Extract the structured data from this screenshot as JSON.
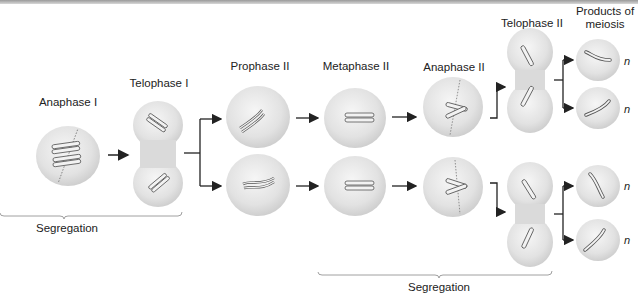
{
  "colors": {
    "cell_fill": "#dcdcdc",
    "cell_highlight": "#f4f4f4",
    "chromosome_fill": "#f2f2f2",
    "chromosome_stroke": "#555555",
    "arrow": "#222222",
    "bracket": "#888888"
  },
  "stages": [
    {
      "id": "anaphase-1",
      "label": "Anaphase I"
    },
    {
      "id": "telophase-1",
      "label": "Telophase I"
    },
    {
      "id": "prophase-2",
      "label": "Prophase II"
    },
    {
      "id": "metaphase-2",
      "label": "Metaphase II"
    },
    {
      "id": "anaphase-2",
      "label": "Anaphase II"
    },
    {
      "id": "telophase-2",
      "label": "Telophase II"
    },
    {
      "id": "products",
      "label_line1": "Products of",
      "label_line2": "meiosis"
    }
  ],
  "brackets": [
    {
      "id": "segregation-1",
      "label": "Segregation"
    },
    {
      "id": "segregation-2",
      "label": "Segregation"
    }
  ],
  "ploidy_label": "n",
  "product_count": 4
}
